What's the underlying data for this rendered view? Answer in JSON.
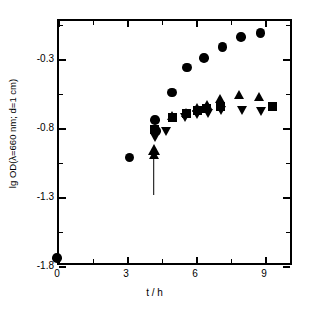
{
  "chart_data": {
    "type": "scatter",
    "title": "",
    "xlabel": "t / h",
    "ylabel": "lg OD(λ=660 nm; d=1 cm)",
    "xlim": [
      0,
      10.2
    ],
    "ylim": [
      -1.8,
      -0.02
    ],
    "grid": false,
    "legend": "none",
    "x_ticks_major": [
      0,
      3,
      6,
      9
    ],
    "x_tick_labels": [
      "0",
      "3",
      "6",
      "9"
    ],
    "x_ticks_minor": [
      1.5,
      4.5,
      7.5
    ],
    "y_ticks_major": [
      -0.3,
      -0.8,
      -1.3,
      -1.8
    ],
    "y_tick_labels": [
      "-0.3",
      "-0.8",
      "-1.3",
      "-1.8"
    ],
    "y_ticks_minor": [
      -0.05,
      -0.55,
      -1.05,
      -1.55
    ],
    "annotations": [
      {
        "name": "inoculation-arrow",
        "type": "arrow-up",
        "x": 4.2,
        "y_tail": -1.3,
        "y_head": -1.0
      }
    ],
    "series": [
      {
        "name": "circles",
        "marker": "circle",
        "color": "#000000",
        "points": [
          {
            "x": 0.0,
            "y": -1.75
          },
          {
            "x": 3.15,
            "y": -1.02
          },
          {
            "x": 4.25,
            "y": -0.75
          },
          {
            "x": 4.3,
            "y": -0.83
          },
          {
            "x": 5.0,
            "y": -0.55
          },
          {
            "x": 5.65,
            "y": -0.37
          },
          {
            "x": 6.4,
            "y": -0.3
          },
          {
            "x": 7.2,
            "y": -0.22
          },
          {
            "x": 8.0,
            "y": -0.15
          },
          {
            "x": 8.85,
            "y": -0.12
          }
        ]
      },
      {
        "name": "squares",
        "marker": "square",
        "color": "#000000",
        "points": [
          {
            "x": 4.25,
            "y": -0.82
          },
          {
            "x": 5.0,
            "y": -0.73
          },
          {
            "x": 5.65,
            "y": -0.7
          },
          {
            "x": 6.1,
            "y": -0.68
          },
          {
            "x": 6.5,
            "y": -0.67
          },
          {
            "x": 7.1,
            "y": -0.65
          },
          {
            "x": 9.35,
            "y": -0.65
          }
        ]
      },
      {
        "name": "up-triangles",
        "marker": "triangle-up",
        "color": "#000000",
        "points": [
          {
            "x": 4.2,
            "y": -1.0
          },
          {
            "x": 5.0,
            "y": -0.72
          },
          {
            "x": 5.6,
            "y": -0.7
          },
          {
            "x": 6.1,
            "y": -0.66
          },
          {
            "x": 6.5,
            "y": -0.64
          },
          {
            "x": 7.1,
            "y": -0.6
          },
          {
            "x": 7.9,
            "y": -0.57
          },
          {
            "x": 8.8,
            "y": -0.58
          }
        ]
      },
      {
        "name": "down-triangles",
        "marker": "triangle-down",
        "color": "#000000",
        "points": [
          {
            "x": 4.25,
            "y": -0.88
          },
          {
            "x": 4.75,
            "y": -0.83
          },
          {
            "x": 5.55,
            "y": -0.73
          },
          {
            "x": 6.1,
            "y": -0.71
          },
          {
            "x": 6.55,
            "y": -0.7
          },
          {
            "x": 7.15,
            "y": -0.68
          },
          {
            "x": 8.05,
            "y": -0.68
          },
          {
            "x": 8.85,
            "y": -0.69
          }
        ]
      }
    ]
  },
  "geometry": {
    "px_left": 57,
    "px_right": 292,
    "px_top": 19,
    "px_bottom": 265,
    "x_min": 0,
    "x_max": 10.217,
    "y_min": -1.8,
    "y_max": -0.0185
  }
}
